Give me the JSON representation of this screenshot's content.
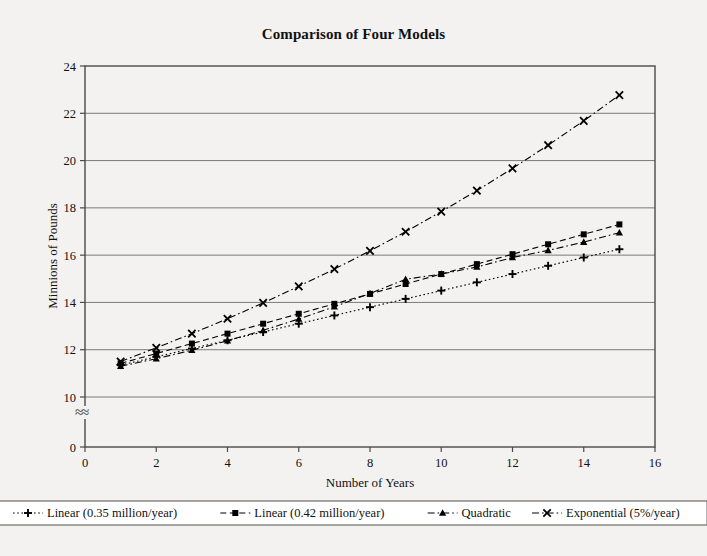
{
  "chart_data": {
    "type": "line",
    "title": "Comparison of Four Models",
    "xlabel": "Number of Years",
    "ylabel": "Minnions of Pounds",
    "xlim": [
      0,
      16
    ],
    "xticks": [
      0,
      2,
      4,
      6,
      8,
      10,
      12,
      14,
      16
    ],
    "ylim": [
      10,
      24
    ],
    "yticks": [
      10,
      12,
      14,
      16,
      18,
      20,
      22,
      24
    ],
    "y_zero_tick": 0,
    "y_axis_break": true,
    "y_axis_break_symbol": "≈",
    "grid": "horizontal",
    "legend_position": "bottom",
    "x": [
      1,
      2,
      3,
      4,
      5,
      6,
      7,
      8,
      9,
      10,
      11,
      12,
      13,
      14,
      15
    ],
    "series": [
      {
        "name": "Linear (0.35 million/year)",
        "marker": "plus",
        "dash": "dotted",
        "color": "#000000",
        "values": [
          11.35,
          11.7,
          12.05,
          12.4,
          12.75,
          13.1,
          13.45,
          13.8,
          14.15,
          14.5,
          14.85,
          15.2,
          15.55,
          15.9,
          16.25
        ]
      },
      {
        "name": "Linear (0.42 million/year)",
        "marker": "square",
        "dash": "dashed",
        "color": "#000000",
        "values": [
          11.42,
          11.84,
          12.26,
          12.68,
          13.1,
          13.52,
          13.94,
          14.36,
          14.78,
          15.2,
          15.62,
          16.04,
          16.46,
          16.88,
          17.3
        ]
      },
      {
        "name": "Quadratic",
        "marker": "triangle",
        "dash": "dashdot",
        "color": "#000000",
        "values": [
          11.3,
          11.62,
          11.98,
          12.38,
          12.82,
          13.3,
          13.82,
          14.38,
          14.98,
          15.2,
          15.5,
          15.9,
          16.2,
          16.55,
          16.95
        ]
      },
      {
        "name": "Exponential (5%/year)",
        "marker": "cross",
        "dash": "dashdot",
        "color": "#000000",
        "values": [
          11.5,
          12.08,
          12.68,
          13.31,
          13.98,
          14.68,
          15.41,
          16.18,
          16.99,
          17.84,
          18.73,
          19.67,
          20.65,
          21.68,
          22.77
        ]
      }
    ]
  }
}
